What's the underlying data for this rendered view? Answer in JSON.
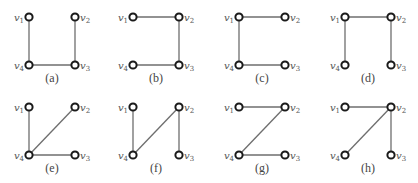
{
  "figure": {
    "style": {
      "edge_color": "#6e6e6e",
      "node_stroke": "#1a1a1a",
      "node_fill": "#ffffff",
      "label_color": "#555555"
    },
    "panels": [
      {
        "caption": "(a)",
        "origin": [
          29,
          17
        ],
        "edges": [
          [
            "v1",
            "v4"
          ],
          [
            "v4",
            "v3"
          ],
          [
            "v2",
            "v3"
          ]
        ]
      },
      {
        "caption": "(b)",
        "origin": [
          133,
          17
        ],
        "edges": [
          [
            "v1",
            "v2"
          ],
          [
            "v2",
            "v3"
          ],
          [
            "v4",
            "v3"
          ]
        ]
      },
      {
        "caption": "(c)",
        "origin": [
          239,
          17
        ],
        "edges": [
          [
            "v1",
            "v2"
          ],
          [
            "v1",
            "v4"
          ],
          [
            "v4",
            "v3"
          ]
        ]
      },
      {
        "caption": "(d)",
        "origin": [
          345,
          17
        ],
        "edges": [
          [
            "v1",
            "v2"
          ],
          [
            "v1",
            "v4"
          ],
          [
            "v2",
            "v3"
          ]
        ]
      },
      {
        "caption": "(e)",
        "origin": [
          29,
          107
        ],
        "edges": [
          [
            "v1",
            "v4"
          ],
          [
            "v4",
            "v2"
          ],
          [
            "v4",
            "v3"
          ]
        ]
      },
      {
        "caption": "(f)",
        "origin": [
          133,
          107
        ],
        "edges": [
          [
            "v1",
            "v4"
          ],
          [
            "v4",
            "v2"
          ],
          [
            "v2",
            "v3"
          ]
        ]
      },
      {
        "caption": "(g)",
        "origin": [
          239,
          107
        ],
        "edges": [
          [
            "v1",
            "v2"
          ],
          [
            "v2",
            "v4"
          ],
          [
            "v4",
            "v3"
          ]
        ]
      },
      {
        "caption": "(h)",
        "origin": [
          345,
          107
        ],
        "edges": [
          [
            "v1",
            "v2"
          ],
          [
            "v2",
            "v4"
          ],
          [
            "v2",
            "v3"
          ]
        ]
      }
    ],
    "vertices": {
      "v1": {
        "label": "v",
        "sub": "1",
        "dx": 0,
        "dy": 0,
        "side": "left"
      },
      "v2": {
        "label": "v",
        "sub": "2",
        "dx": 46,
        "dy": 0,
        "side": "right"
      },
      "v3": {
        "label": "v",
        "sub": "3",
        "dx": 46,
        "dy": 48,
        "side": "right"
      },
      "v4": {
        "label": "v",
        "sub": "4",
        "dx": 0,
        "dy": 48,
        "side": "left"
      }
    }
  }
}
